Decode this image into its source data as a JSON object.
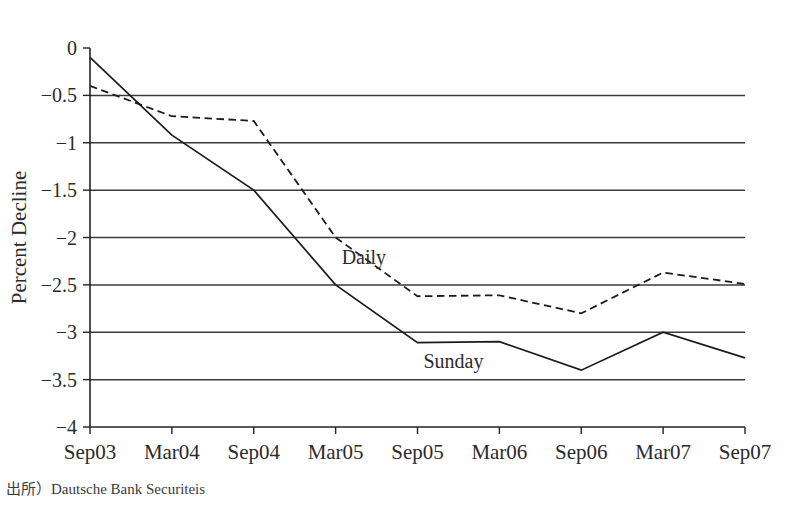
{
  "figure": {
    "clipped_header_text": "",
    "footnote": "出所）Dautsche Bank Securiteis"
  },
  "chart_data": {
    "type": "line",
    "title": "",
    "subtitle": "",
    "xlabel": "",
    "ylabel": "Percent Decline",
    "x": [
      "Sep03",
      "Mar04",
      "Sep04",
      "Mar05",
      "Sep05",
      "Mar06",
      "Sep06",
      "Mar07",
      "Sep07"
    ],
    "categories": [
      "Sep03",
      "Mar04",
      "Sep04",
      "Mar05",
      "Sep05",
      "Mar06",
      "Sep06",
      "Mar07",
      "Sep07"
    ],
    "xtick_labels": [
      "Sep03",
      "Mar04",
      "Sep04",
      "Mar05",
      "Sep05",
      "Mar06",
      "Sep06",
      "Mar07",
      "Sep07"
    ],
    "ytick_labels": [
      "0",
      "−0.5",
      "−1",
      "−1.5",
      "−2",
      "−2.5",
      "−3",
      "−3.5",
      "−4"
    ],
    "ytick_values": [
      0,
      -0.5,
      -1,
      -1.5,
      -2,
      -2.5,
      -3,
      -3.5,
      -4
    ],
    "ylim": [
      -4,
      0
    ],
    "grid": "horizontal",
    "gridline_values": [
      -0.5,
      -1,
      -1.5,
      -2,
      -2.5,
      -3,
      -3.5
    ],
    "legend": "inline-annotation",
    "series": [
      {
        "name": "Daily",
        "style": "dashed",
        "color": "#1b1b1b",
        "values": [
          -0.4,
          -0.72,
          -0.77,
          -2.0,
          -2.62,
          -2.61,
          -2.8,
          -2.37,
          -2.49
        ],
        "label_x": "Mar05",
        "label_y": -2.28
      },
      {
        "name": "Sunday",
        "style": "solid",
        "color": "#1b1b1b",
        "values": [
          -0.1,
          -0.92,
          -1.5,
          -2.5,
          -3.11,
          -3.1,
          -3.4,
          -3.0,
          -3.27
        ],
        "label_x": "Sep05",
        "label_y": -3.38
      }
    ]
  }
}
